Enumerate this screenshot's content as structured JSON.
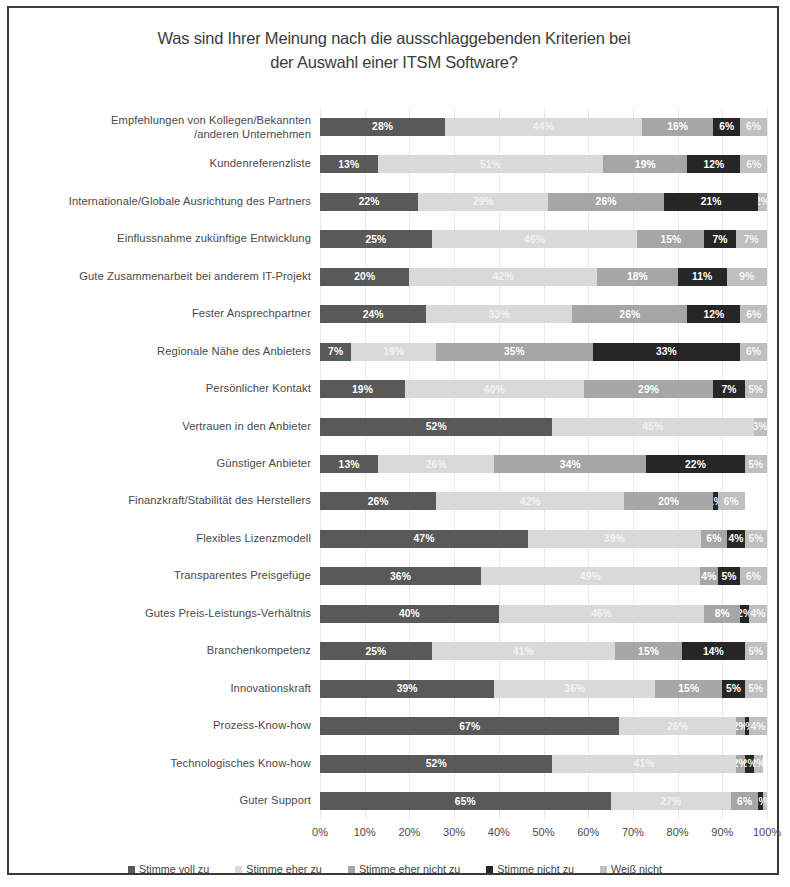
{
  "title": {
    "line1": "Was sind Ihrer Meinung nach die ausschlaggebenden Kriterien bei",
    "line2": "der Auswahl einer ITSM Software?"
  },
  "axis": {
    "ticks": [
      "0%",
      "10%",
      "20%",
      "30%",
      "40%",
      "50%",
      "60%",
      "70%",
      "80%",
      "90%",
      "100%"
    ]
  },
  "legend": [
    {
      "label": "Stimme voll zu",
      "color": "#595959"
    },
    {
      "label": "Stimme eher zu",
      "color": "#d9d9d9"
    },
    {
      "label": "Stimme eher nicht zu",
      "color": "#a6a6a6"
    },
    {
      "label": "Stimme nicht zu",
      "color": "#262626"
    },
    {
      "label": "Weiß nicht",
      "color": "#bfbfbf"
    }
  ],
  "chart_data": {
    "type": "bar",
    "orientation": "horizontal",
    "stacked": true,
    "normalized": "percent",
    "title": "Was sind Ihrer Meinung nach die ausschlaggebenden Kriterien bei der Auswahl einer ITSM Software?",
    "xlabel": "",
    "ylabel": "",
    "xlim": [
      0,
      100
    ],
    "xticks": [
      0,
      10,
      20,
      30,
      40,
      50,
      60,
      70,
      80,
      90,
      100
    ],
    "grid": true,
    "legend_position": "bottom",
    "value_format": "percent",
    "colors": [
      "#595959",
      "#d9d9d9",
      "#a6a6a6",
      "#262626",
      "#bfbfbf"
    ],
    "categories": [
      "Empfehlungen von Kollegen/Bekannten\n/anderen Unternehmen",
      "Kundenreferenzliste",
      "Internationale/Globale Ausrichtung des Partners",
      "Einflussnahme zukünftige Entwicklung",
      "Gute Zusammenarbeit bei anderem IT-Projekt",
      "Fester Ansprechpartner",
      "Regionale Nähe des Anbieters",
      "Persönlicher Kontakt",
      "Vertrauen in den Anbieter",
      "Günstiger Anbieter",
      "Finanzkraft/Stabilität des Herstellers",
      "Flexibles Lizenzmodell",
      "Transparentes Preisgefüge",
      "Gutes Preis-Leistungs-Verhältnis",
      "Branchenkompetenz",
      "Innovationskraft",
      "Prozess-Know-how",
      "Technologisches Know-how",
      "Guter Support"
    ],
    "series": [
      {
        "name": "Stimme voll zu",
        "values": [
          28,
          13,
          22,
          25,
          20,
          24,
          7,
          19,
          52,
          13,
          26,
          47,
          36,
          40,
          25,
          39,
          67,
          52,
          65
        ]
      },
      {
        "name": "Stimme eher zu",
        "values": [
          44,
          51,
          29,
          46,
          42,
          33,
          19,
          40,
          45,
          26,
          42,
          39,
          49,
          46,
          41,
          36,
          26,
          41,
          27
        ]
      },
      {
        "name": "Stimme eher nicht zu",
        "values": [
          16,
          19,
          26,
          15,
          18,
          26,
          35,
          29,
          0,
          34,
          20,
          6,
          4,
          8,
          15,
          15,
          2,
          2,
          6
        ]
      },
      {
        "name": "Stimme nicht zu",
        "values": [
          6,
          12,
          21,
          7,
          11,
          12,
          33,
          7,
          0,
          22,
          1,
          4,
          5,
          2,
          14,
          5,
          1,
          2,
          1
        ]
      },
      {
        "name": "Weiß nicht",
        "values": [
          6,
          6,
          2,
          7,
          9,
          6,
          6,
          5,
          3,
          5,
          6,
          5,
          6,
          4,
          5,
          5,
          4,
          2,
          1
        ]
      }
    ],
    "labels": [
      [
        "28%",
        "44%",
        "16%",
        "6%",
        "6%"
      ],
      [
        "13%",
        "51%",
        "19%",
        "12%",
        "6%"
      ],
      [
        "22%",
        "29%",
        "26%",
        "21%",
        "2%"
      ],
      [
        "25%",
        "46%",
        "15%",
        "7%",
        "7%"
      ],
      [
        "20%",
        "42%",
        "18%",
        "11%",
        "9%"
      ],
      [
        "24%",
        "33%",
        "26%",
        "12%",
        "6%"
      ],
      [
        "7%",
        "19%",
        "35%",
        "33%",
        "6%"
      ],
      [
        "19%",
        "40%",
        "29%",
        "7%",
        "5%"
      ],
      [
        "52%",
        "45%",
        "",
        "",
        "3%"
      ],
      [
        "13%",
        "26%",
        "34%",
        "22%",
        "5%"
      ],
      [
        "26%",
        "42%",
        "20%",
        "1%",
        "6%"
      ],
      [
        "47%",
        "39%",
        "6%",
        "4%",
        "5%"
      ],
      [
        "36%",
        "49%",
        "4%",
        "5%",
        "6%"
      ],
      [
        "40%",
        "46%",
        "8%",
        "2%",
        "4%"
      ],
      [
        "25%",
        "41%",
        "15%",
        "14%",
        "5%"
      ],
      [
        "39%",
        "36%",
        "15%",
        "5%",
        "5%"
      ],
      [
        "67%",
        "26%",
        "2%",
        "1%",
        "4%"
      ],
      [
        "52%",
        "41%",
        "2%",
        "2%",
        "2%"
      ],
      [
        "65%",
        "27%",
        "6%",
        "1%",
        "1%"
      ]
    ]
  }
}
